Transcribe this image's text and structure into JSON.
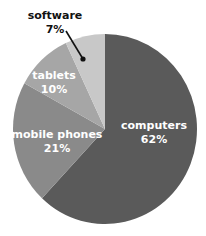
{
  "chart_data": {
    "type": "pie",
    "title": "",
    "categories": [
      "computers",
      "mobile phones",
      "tablets",
      "software"
    ],
    "values": [
      62,
      21,
      10,
      7
    ],
    "labels": [
      "62%",
      "21%",
      "10%",
      "7%"
    ],
    "colors": [
      "#5a5a5a",
      "#8a8a8a",
      "#a6a6a6",
      "#c8c8c8"
    ],
    "legend": "none (inline labels)"
  },
  "slices": [
    {
      "name": "computers",
      "pct": "62%"
    },
    {
      "name": "mobile phones",
      "pct": "21%"
    },
    {
      "name": "tablets",
      "pct": "10%"
    },
    {
      "name": "software",
      "pct": "7%"
    }
  ]
}
